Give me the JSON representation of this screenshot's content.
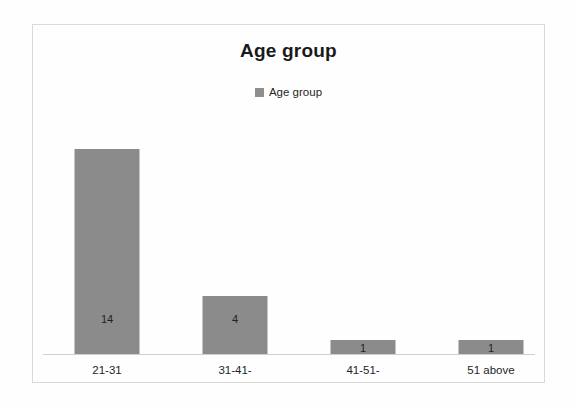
{
  "chart_data": {
    "type": "bar",
    "title": "Age group",
    "xlabel": "",
    "ylabel": "",
    "categories": [
      "21-31",
      "31-41-",
      "41-51-",
      "51 above"
    ],
    "values": [
      14,
      4,
      1,
      1
    ],
    "value_labels": [
      "14",
      "4",
      "1",
      "1"
    ],
    "series": [
      {
        "name": "Age group",
        "values": [
          14,
          4,
          1,
          1
        ],
        "color": "#8b8b8b"
      }
    ],
    "ylim": [
      0,
      15.6
    ],
    "grid": false,
    "legend": {
      "position": "top-center",
      "entries": [
        {
          "label": "Age group",
          "color": "#8b8b8b"
        }
      ]
    },
    "axis": {
      "baseline_visible": true,
      "y_axis_visible": false,
      "tick_labels_y": []
    },
    "colors": {
      "bar_fill": "#8b8b8b",
      "background": "#fefefe",
      "frame_border": "#d9d9d9",
      "axis_line": "#d0d0d0",
      "text": "#1f1f1f",
      "title_text": "#1a1a1a"
    }
  }
}
